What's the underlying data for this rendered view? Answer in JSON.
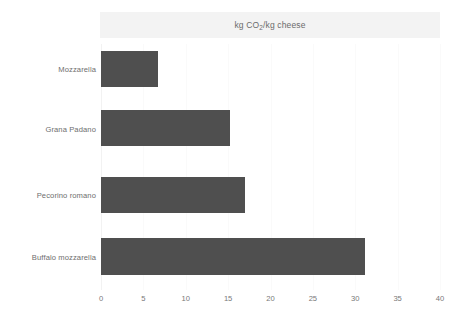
{
  "chart_data": {
    "type": "bar",
    "orientation": "horizontal",
    "title": "kg CO2/kg cheese",
    "title_parts": {
      "before": "kg CO",
      "sub": "2",
      "after": "/kg cheese"
    },
    "xlabel": "",
    "ylabel": "",
    "categories": [
      "Mozzarella",
      "Grana Padano",
      "Pecorino romano",
      "Buffalo mozzarella"
    ],
    "values": [
      6.7,
      15.2,
      17.0,
      31.1
    ],
    "xlim": [
      0,
      40
    ],
    "xticks": [
      0,
      5,
      10,
      15,
      20,
      25,
      30,
      35,
      40
    ],
    "xtick_labels": [
      "0",
      "5",
      "10",
      "15",
      "20",
      "25",
      "30",
      "35",
      "40"
    ],
    "grid": true,
    "legend": false,
    "bar_color": "#4f4f4f",
    "title_band_color": "#f3f3f3",
    "background_color": "#ffffff",
    "text_color": "#6e6e6e"
  }
}
